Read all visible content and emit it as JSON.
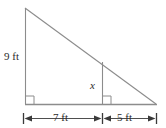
{
  "figure": {
    "kind": "geometry-diagram",
    "stroke_color": "#8c8c8c",
    "text_color": "#2b2b2b",
    "background_color": "#ffffff",
    "labels": {
      "left_leg": "9 ft",
      "inner_height": "x",
      "base_left_segment": "7 ft",
      "base_right_segment": "5 ft"
    },
    "geometry": {
      "apex": {
        "x": 25,
        "y": 8
      },
      "bottom_left": {
        "x": 25,
        "y": 104
      },
      "bottom_right": {
        "x": 156,
        "y": 104
      },
      "inner_foot": {
        "x": 102,
        "y": 104
      },
      "inner_top": {
        "x": 102,
        "y": 62
      },
      "right_angle_marks": [
        {
          "x": 25,
          "y": 104,
          "note": "bottom-left vertex"
        },
        {
          "x": 102,
          "y": 104,
          "note": "foot of inner vertical segment"
        }
      ],
      "dimension_line_y": 118,
      "dimension_ticks_x": [
        23,
        102,
        156
      ]
    },
    "measurements": {
      "triangle_height_ft": 9,
      "base_left_ft": 7,
      "base_right_ft": 5,
      "base_total_ft": 12,
      "unknown_label": "x"
    }
  }
}
